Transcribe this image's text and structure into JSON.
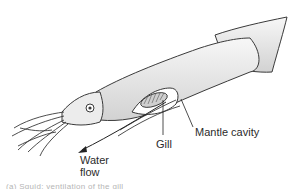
{
  "diagram": {
    "labels": {
      "water_flow_line1": "Water",
      "water_flow_line2": "flow",
      "gill": "Gill",
      "mantle_cavity": "Mantle cavity"
    },
    "caption": "(a) Squid: ventilation of the gill",
    "colors": {
      "outline": "#3a3a3a",
      "body_fill": "#f0f0f0",
      "body_shade": "#d4d4d4",
      "background": "#ffffff",
      "label_text": "#2b2b2b"
    }
  }
}
